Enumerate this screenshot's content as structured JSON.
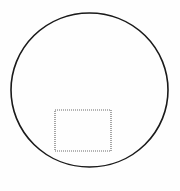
{
  "figure": {
    "title": "Circle with inscribed dotted rectangle",
    "background_color": "#fefefe",
    "canvas": {
      "width": 180,
      "height": 191
    },
    "shapes": [
      {
        "name": "outer-circle",
        "kind": "ellipse",
        "center_x": 89.5,
        "center_y": 90.0,
        "radius_x": 78.5,
        "radius_y": 77.0,
        "stroke_color": "#1a1a1a",
        "stroke_width": 1.6,
        "fill": "none",
        "stroke_style": "solid"
      },
      {
        "name": "inner-rectangle",
        "kind": "rectangle",
        "x": 55.0,
        "y": 110.0,
        "width": 56.0,
        "height": 41.0,
        "stroke_color": "#6b6b6b",
        "stroke_width": 1.2,
        "fill": "none",
        "stroke_style": "dotted",
        "dash_pattern": "1 1"
      }
    ]
  }
}
